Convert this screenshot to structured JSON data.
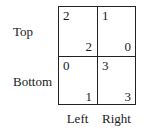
{
  "rows": [
    "Top",
    "Bottom"
  ],
  "columns": [
    "Left",
    "Right"
  ],
  "payoffs": [
    [
      {
        "row_player": "2",
        "col_player": "2"
      },
      {
        "row_player": "1",
        "col_player": "0"
      }
    ],
    [
      {
        "row_player": "0",
        "col_player": "1"
      },
      {
        "row_player": "3",
        "col_player": "3"
      }
    ]
  ]
}
